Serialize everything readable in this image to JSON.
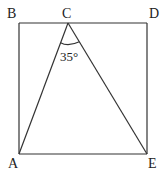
{
  "diagram": {
    "points": {
      "A": "A",
      "B": "B",
      "C": "C",
      "D": "D",
      "E": "E"
    },
    "angle_label": "35°",
    "segments": [
      "BD",
      "BA",
      "DE",
      "AE",
      "CA",
      "CE"
    ]
  }
}
